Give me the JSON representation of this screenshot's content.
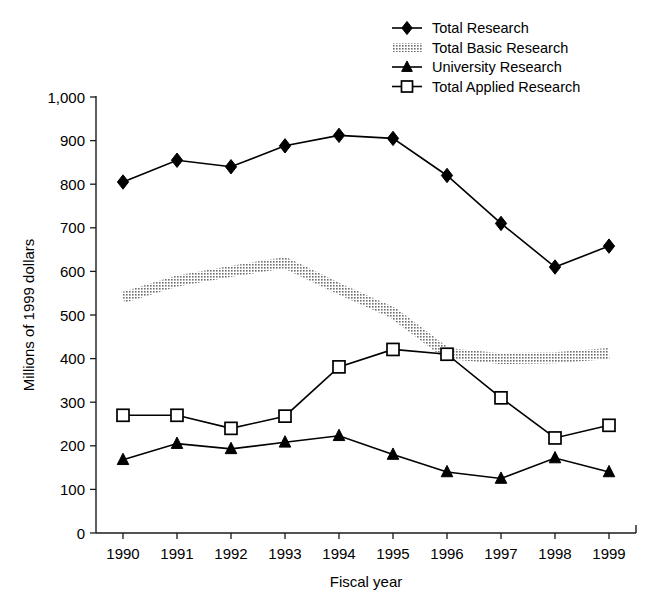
{
  "chart_data": {
    "type": "line",
    "title": "",
    "xlabel": "Fiscal year",
    "ylabel": "Millions of 1999 dollars",
    "categories": [
      "1990",
      "1991",
      "1992",
      "1993",
      "1994",
      "1995",
      "1996",
      "1997",
      "1998",
      "1999"
    ],
    "x": [
      1990,
      1991,
      1992,
      1993,
      1994,
      1995,
      1996,
      1997,
      1998,
      1999
    ],
    "xlim": [
      1990,
      1999
    ],
    "ylim": [
      0,
      1000
    ],
    "y_ticks": [
      "0",
      "100",
      "200",
      "300",
      "400",
      "500",
      "600",
      "700",
      "800",
      "900",
      "1,000"
    ],
    "y_tick_values": [
      0,
      100,
      200,
      300,
      400,
      500,
      600,
      700,
      800,
      900,
      1000
    ],
    "grid": false,
    "legend_position": "top-center-right",
    "series": [
      {
        "name": "Total Research",
        "marker": "filled-diamond",
        "color": "#000000",
        "values": [
          805,
          855,
          840,
          888,
          912,
          905,
          820,
          710,
          610,
          658
        ]
      },
      {
        "name": "Total Basic Research",
        "marker": "thick-gray-band",
        "color": "#8c8c8c",
        "values": [
          540,
          578,
          600,
          620,
          560,
          505,
          412,
          400,
          402,
          412
        ]
      },
      {
        "name": "University Research",
        "marker": "filled-triangle",
        "color": "#000000",
        "values": [
          168,
          205,
          193,
          208,
          223,
          180,
          140,
          125,
          172,
          140
        ]
      },
      {
        "name": "Total Applied Research",
        "marker": "open-square",
        "color": "#000000",
        "values": [
          270,
          270,
          240,
          268,
          381,
          421,
          410,
          310,
          218,
          247
        ]
      }
    ]
  },
  "legend": {
    "items": [
      {
        "label": "Total Research",
        "marker": "filled-diamond"
      },
      {
        "label": "Total Basic Research",
        "marker": "thick-gray-band"
      },
      {
        "label": "University Research",
        "marker": "filled-triangle"
      },
      {
        "label": "Total Applied Research",
        "marker": "open-square"
      }
    ]
  },
  "axes": {
    "y_title": "Millions of 1999 dollars",
    "x_title": "Fiscal year",
    "y_tick_labels": [
      "1,000",
      "900",
      "800",
      "700",
      "600",
      "500",
      "400",
      "300",
      "200",
      "100",
      "0"
    ],
    "x_tick_labels": [
      "1990",
      "1991",
      "1992",
      "1993",
      "1994",
      "1995",
      "1996",
      "1997",
      "1998",
      "1999"
    ]
  },
  "colors": {
    "line": "#000000",
    "band": "#8c8c8c",
    "axis": "#1a1a1a",
    "background": "#ffffff"
  }
}
